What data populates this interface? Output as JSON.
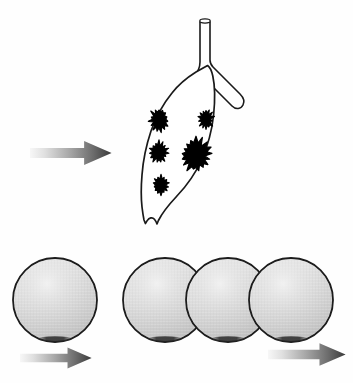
{
  "figure": {
    "title": "Lung metastasis progression schematic",
    "background_color": "#fefefe",
    "width": 353,
    "height": 383,
    "caption": ""
  },
  "palette": {
    "outline": "#1a1a1a",
    "nodule_fill": "#000000",
    "sphere_fill_light": "#e4e4e4",
    "sphere_fill_mid": "#cfcfcf",
    "sphere_fill_dark": "#bdbdbd",
    "sphere_stroke": "#1c1c1c",
    "sphere_shadow": "#2b2b2b",
    "arrow_gradient_start": "#f4f4f4",
    "arrow_gradient_mid": "#9a9a9a",
    "arrow_gradient_end": "#3d3d3d"
  },
  "panels": [
    {
      "id": "lung-panel",
      "label": "Lung with metastatic nodules",
      "row": "top"
    },
    {
      "id": "spheroid-panel",
      "label": "Tumor cell spheroids",
      "row": "bottom"
    }
  ],
  "arrows": [
    {
      "id": "arrow-into-lung",
      "label": "arrow pointing right into lung",
      "x": 30,
      "y": 140,
      "width": 82,
      "height": 26,
      "direction": "right",
      "gradient": "light-to-dark"
    },
    {
      "id": "arrow-left-spheroid",
      "label": "arrow pointing right from single spheroid",
      "x": 20,
      "y": 346,
      "width": 72,
      "height": 24,
      "direction": "right",
      "gradient": "light-to-dark"
    },
    {
      "id": "arrow-right-spheroid",
      "label": "arrow pointing right from spheroid chain",
      "x": 268,
      "y": 342,
      "width": 78,
      "height": 25,
      "direction": "right",
      "gradient": "light-to-dark"
    }
  ],
  "lung": {
    "id": "lung-lobe",
    "label": "Lung lobe outline",
    "outline_path": "M 196 72 C 188 78 180 84 173 92 C 164 102 157 114 152 127 C 147 141 144 156 143 170 C 142 182 142 194 143 204 C 143.5 209 144 214 144.5 218 L 145.5 221 L 147 219 C 149 216 152 215 154 217 C 156 219 157 222 157 222 L 158 219 C 162 212 168 205 175 198 C 185 188 194 177 200 164 C 207 150 211 135 213 120 C 215 104 215 90 213 78 C 212 72 210 68 208 66 Z",
    "stroke_width": 1.6,
    "fill": "#ffffff"
  },
  "airway": {
    "id": "trachea-bronchus",
    "label": "Trachea with bronchial bifurcation",
    "tube_top_y": 18,
    "tube_bottom_y": 72,
    "ring_label": "tracheal rim ellipse",
    "stroke_width": 1.6
  },
  "nodules": [
    {
      "id": "nodule-1",
      "label": "metastatic nodule upper left",
      "cx": 159,
      "cy": 120,
      "rx": 9.5,
      "ry": 11.5,
      "points": 15,
      "inner_ratio": 0.66
    },
    {
      "id": "nodule-2",
      "label": "metastatic nodule upper right",
      "cx": 206,
      "cy": 119,
      "rx": 7.5,
      "ry": 10.0,
      "points": 14,
      "inner_ratio": 0.64
    },
    {
      "id": "nodule-3",
      "label": "metastatic nodule middle left",
      "cx": 159,
      "cy": 152,
      "rx": 9.0,
      "ry": 10.5,
      "points": 15,
      "inner_ratio": 0.66
    },
    {
      "id": "nodule-4",
      "label": "metastatic nodule large center",
      "cx": 196,
      "cy": 155,
      "rx": 15.5,
      "ry": 16.5,
      "points": 17,
      "inner_ratio": 0.68
    },
    {
      "id": "nodule-5",
      "label": "metastatic nodule lower left",
      "cx": 161,
      "cy": 185,
      "rx": 8.0,
      "ry": 9.5,
      "points": 14,
      "inner_ratio": 0.65
    }
  ],
  "spheroids": [
    {
      "id": "spheroid-single",
      "label": "single tumor spheroid",
      "cx": 55,
      "cy": 300,
      "r": 42,
      "group": "left"
    },
    {
      "id": "spheroid-chain-1",
      "label": "tumor spheroid chain member one",
      "cx": 165,
      "cy": 300,
      "r": 42,
      "group": "right"
    },
    {
      "id": "spheroid-chain-2",
      "label": "tumor spheroid chain member two",
      "cx": 228,
      "cy": 300,
      "r": 42,
      "group": "right"
    },
    {
      "id": "spheroid-chain-3",
      "label": "tumor spheroid chain member three",
      "cx": 291,
      "cy": 300,
      "r": 42,
      "group": "right"
    }
  ]
}
